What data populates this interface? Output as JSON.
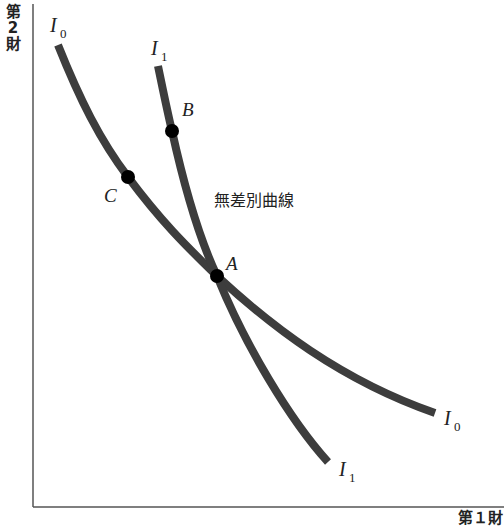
{
  "axes": {
    "y_label_chars": [
      "第",
      "2",
      "財"
    ],
    "x_label": "第１財"
  },
  "curves": [
    {
      "name": "I0",
      "base": "I",
      "sub": "0",
      "color": "#3d3d3d"
    },
    {
      "name": "I1",
      "base": "I",
      "sub": "1",
      "color": "#3d3d3d"
    }
  ],
  "points": [
    {
      "label": "A"
    },
    {
      "label": "B"
    },
    {
      "label": "C"
    }
  ],
  "annotation": "無差別曲線",
  "colors": {
    "axis": "#555555",
    "curve": "#3d3d3d",
    "point": "#000000",
    "text": "#222222"
  }
}
